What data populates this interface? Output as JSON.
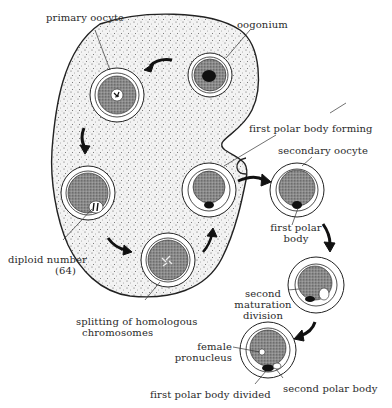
{
  "diagram": {
    "colors": {
      "ink": "#2a2a2a",
      "stipple": "#6a6a6a",
      "cell_fill": "#8a8a8a",
      "background": "#ffffff"
    },
    "labels": {
      "primary_oocyte": "primary oocyte",
      "oogonium": "oogonium",
      "first_polar_body_forming": "first polar body forming",
      "secondary_oocyte": "secondary oocyte",
      "first_polar_body_line1": "first polar",
      "first_polar_body_line2": "body",
      "diploid_number_line1": "diploid number",
      "diploid_number_line2": "(64)",
      "splitting_line1": "splitting of homologous",
      "splitting_line2": "chromosomes",
      "second_maturation_line1": "second",
      "second_maturation_line2": "maturation",
      "second_maturation_line3": "division",
      "female_pronucleus_line1": "female",
      "female_pronucleus_line2": "pronucleus",
      "first_polar_body_divided": "first polar body divided",
      "second_polar_body": "second polar body"
    },
    "stages": [
      {
        "name": "oogonium",
        "order": 1
      },
      {
        "name": "primary oocyte",
        "order": 2
      },
      {
        "name": "diploid number (64)",
        "order": 3
      },
      {
        "name": "splitting of homologous chromosomes",
        "order": 4
      },
      {
        "name": "first polar body forming",
        "order": 5
      },
      {
        "name": "secondary oocyte",
        "order": 6
      },
      {
        "name": "second maturation division",
        "order": 7
      },
      {
        "name": "female pronucleus",
        "order": 8
      }
    ]
  }
}
